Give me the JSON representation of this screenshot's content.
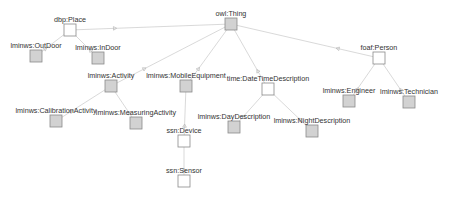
{
  "diagram": {
    "title": "",
    "colors": {
      "edge": "#cfcfcf",
      "box_filled": "#d2d2d2",
      "box_empty": "#ffffff",
      "box_border": "#8a8a8a",
      "label": "#333333"
    },
    "nodes": [
      {
        "id": "owl-thing",
        "label": "owl:Thing",
        "x": 231,
        "y": 24,
        "filled": true
      },
      {
        "id": "dbp-place",
        "label": "dbp:Place",
        "x": 70,
        "y": 30,
        "filled": false
      },
      {
        "id": "lminws-outdoor",
        "label": "lminws:OutDoor",
        "x": 36,
        "y": 56,
        "filled": true
      },
      {
        "id": "lminws-indoor",
        "label": "lminws:InDoor",
        "x": 98,
        "y": 58,
        "filled": true
      },
      {
        "id": "lminws-activity",
        "label": "lminws:Activity",
        "x": 111,
        "y": 86,
        "filled": true
      },
      {
        "id": "lminws-mobileequipment",
        "label": "lminws:MobileEquipment",
        "x": 186,
        "y": 86,
        "filled": true
      },
      {
        "id": "time-datetimedescription",
        "label": "time:DateTimeDescription",
        "x": 268,
        "y": 89,
        "filled": false
      },
      {
        "id": "foaf-person",
        "label": "foaf:Person",
        "x": 379,
        "y": 58,
        "filled": false
      },
      {
        "id": "lminws-engineer",
        "label": "lminws:Engineer",
        "x": 349,
        "y": 101,
        "filled": true
      },
      {
        "id": "lminws-technician",
        "label": "lminws:Technician",
        "x": 409,
        "y": 102,
        "filled": true
      },
      {
        "id": "lminws-calibrationactivity",
        "label": "lminws:CalibrationActivity",
        "x": 56,
        "y": 121,
        "filled": true
      },
      {
        "id": "lminws-measuringactivity",
        "label": "lminws:MeasuringActivity",
        "x": 136,
        "y": 123,
        "filled": true
      },
      {
        "id": "ssn-device",
        "label": "ssn:Device",
        "x": 184,
        "y": 141,
        "filled": false
      },
      {
        "id": "ssn-sensor",
        "label": "ssn:Sensor",
        "x": 184,
        "y": 181,
        "filled": false
      },
      {
        "id": "lminws-daydescription",
        "label": "lminws:DayDescription",
        "x": 234,
        "y": 127,
        "filled": true
      },
      {
        "id": "lminws-nightdescription",
        "label": "lminws:NightDescription",
        "x": 312,
        "y": 131,
        "filled": true
      }
    ],
    "edges": [
      {
        "from": "owl-thing",
        "to": "dbp-place"
      },
      {
        "from": "owl-thing",
        "to": "lminws-activity"
      },
      {
        "from": "owl-thing",
        "to": "lminws-mobileequipment"
      },
      {
        "from": "owl-thing",
        "to": "time-datetimedescription"
      },
      {
        "from": "owl-thing",
        "to": "foaf-person"
      },
      {
        "from": "dbp-place",
        "to": "lminws-outdoor"
      },
      {
        "from": "dbp-place",
        "to": "lminws-indoor"
      },
      {
        "from": "lminws-activity",
        "to": "lminws-calibrationactivity"
      },
      {
        "from": "lminws-activity",
        "to": "lminws-measuringactivity"
      },
      {
        "from": "lminws-mobileequipment",
        "to": "ssn-device"
      },
      {
        "from": "ssn-device",
        "to": "ssn-sensor"
      },
      {
        "from": "time-datetimedescription",
        "to": "lminws-daydescription"
      },
      {
        "from": "time-datetimedescription",
        "to": "lminws-nightdescription"
      },
      {
        "from": "foaf-person",
        "to": "lminws-engineer"
      },
      {
        "from": "foaf-person",
        "to": "lminws-technician"
      }
    ]
  }
}
